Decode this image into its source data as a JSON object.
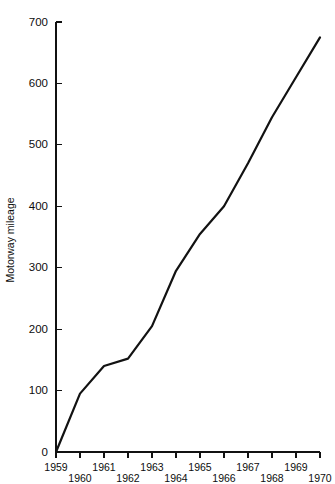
{
  "chart_data": {
    "type": "line",
    "title": "",
    "xlabel": "",
    "ylabel": "Motorway mileage",
    "categories": [
      "1959",
      "1960",
      "1961",
      "1962",
      "1963",
      "1964",
      "1965",
      "1966",
      "1967",
      "1968",
      "1969",
      "1970"
    ],
    "x": [
      1959,
      1960,
      1961,
      1962,
      1963,
      1964,
      1965,
      1966,
      1967,
      1968,
      1969,
      1970
    ],
    "values": [
      0,
      95,
      140,
      152,
      205,
      295,
      355,
      400,
      470,
      545,
      610,
      675
    ],
    "series": [
      {
        "name": "Motorway mileage",
        "values": [
          0,
          95,
          140,
          152,
          205,
          295,
          355,
          400,
          470,
          545,
          610,
          675
        ]
      }
    ],
    "ylim": [
      0,
      700
    ],
    "xlim": [
      1959,
      1970
    ],
    "yticks": [
      0,
      100,
      200,
      300,
      400,
      500,
      600,
      700
    ],
    "ytick_labels": [
      "0",
      "100",
      "200",
      "300",
      "400",
      "500",
      "600",
      "700"
    ],
    "xticks": [
      1959,
      1960,
      1961,
      1962,
      1963,
      1964,
      1965,
      1966,
      1967,
      1968,
      1969,
      1970
    ],
    "xtick_labels": [
      "1959",
      "1960",
      "1961",
      "1962",
      "1963",
      "1964",
      "1965",
      "1966",
      "1967",
      "1968",
      "1969",
      "1970"
    ],
    "xtick_stagger": [
      "up",
      "down",
      "up",
      "down",
      "up",
      "down",
      "up",
      "down",
      "up",
      "down",
      "up",
      "down"
    ],
    "grid": false,
    "legend": false,
    "legend_position": "none",
    "line_color": "#121212",
    "axis_color": "#111111",
    "background_color": "#ffffff",
    "annotations": []
  }
}
